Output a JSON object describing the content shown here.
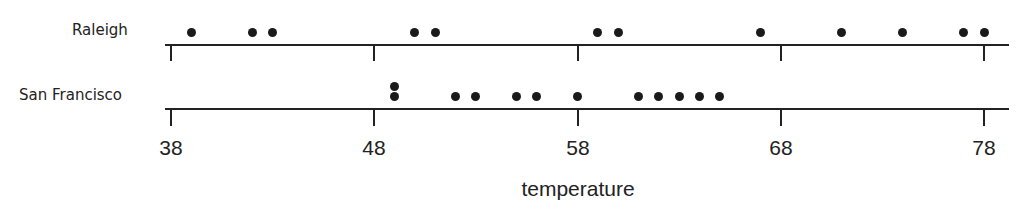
{
  "chart_data": {
    "type": "dot",
    "title": "",
    "xlabel": "temperature",
    "ylabel": "",
    "xlim": [
      38,
      78
    ],
    "x_ticks": [
      38,
      48,
      58,
      68,
      78
    ],
    "grid": false,
    "legend": null,
    "series": [
      {
        "name": "Raleigh",
        "values": [
          39,
          42,
          43,
          50,
          51,
          59,
          60,
          67,
          71,
          74,
          77,
          78
        ]
      },
      {
        "name": "San Francisco",
        "values": [
          49,
          49,
          52,
          53,
          55,
          56,
          58,
          61,
          62,
          63,
          64,
          65
        ]
      }
    ]
  },
  "labels": {
    "row_raleigh": "Raleigh",
    "row_sf": "San Francisco",
    "x_title": "temperature",
    "ticks": [
      "38",
      "48",
      "58",
      "68",
      "78"
    ]
  }
}
